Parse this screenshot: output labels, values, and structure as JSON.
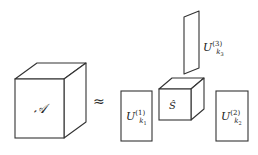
{
  "figure": {
    "type": "tucker-decomposition-diagram",
    "background_color": "#ffffff",
    "stroke_color": "#333333",
    "text_color": "#222222",
    "relation_symbol": "≈",
    "core_tensor": {
      "label_base": "S",
      "accent": "̂",
      "display": "Ŝ"
    },
    "input_tensor": {
      "label_base": "A",
      "display": "𝒜"
    },
    "factors": [
      {
        "name": "factor-1",
        "base": "U",
        "superscript": "(1)",
        "subscript": "k",
        "subscript_index": "1",
        "shape": "tall-rectangle"
      },
      {
        "name": "factor-2",
        "base": "U",
        "superscript": "(2)",
        "subscript": "k",
        "subscript_index": "2",
        "shape": "tall-rectangle"
      },
      {
        "name": "factor-3",
        "base": "U",
        "superscript": "(3)",
        "subscript": "k",
        "subscript_index": "3",
        "shape": "thin-vertical-slab"
      }
    ]
  }
}
